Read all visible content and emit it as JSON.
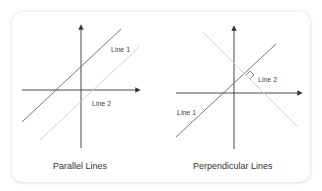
{
  "figures": [
    {
      "id": "parallel",
      "caption": "Parallel Lines",
      "labels": {
        "line1": "Line 1",
        "line2": "Line 2"
      }
    },
    {
      "id": "perpendicular",
      "caption": "Perpendicular Lines",
      "labels": {
        "line1": "Line 1",
        "line2": "Line 2"
      }
    }
  ],
  "colors": {
    "axis": "#333333",
    "line_dark": "#555555",
    "line_light": "#cccccc",
    "text": "#333333"
  }
}
